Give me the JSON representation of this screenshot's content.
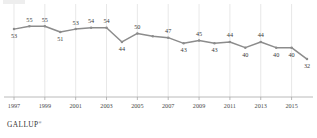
{
  "brand": {
    "name": "GALLUP",
    "mark": "®"
  },
  "chart_data": {
    "type": "line",
    "title": "",
    "subtitle": "",
    "xlabel": "",
    "ylabel": "",
    "grid": "vertical",
    "legend": null,
    "xlim": [
      1997,
      2016
    ],
    "ylim": [
      0,
      60
    ],
    "x": [
      1997,
      1998,
      1999,
      2000,
      2001,
      2002,
      2003,
      2004,
      2005,
      2006,
      2007,
      2008,
      2009,
      2010,
      2011,
      2012,
      2013,
      2014,
      2015,
      2016
    ],
    "values": [
      53,
      55,
      55,
      51,
      53,
      54,
      54,
      44,
      50,
      48,
      47,
      43,
      45,
      43,
      44,
      40,
      44,
      40,
      40,
      32
    ],
    "point_labels": [
      "53",
      "55",
      "55",
      "51",
      "53",
      "54",
      "54",
      "44",
      "50",
      "",
      "47",
      "43",
      "45",
      "43",
      "44",
      "40",
      "44",
      "40",
      "40",
      "32"
    ],
    "label_positions": [
      "below",
      "above",
      "above",
      "below",
      "above",
      "above",
      "above",
      "below",
      "above",
      "",
      "above",
      "below",
      "above",
      "below",
      "above",
      "below",
      "above",
      "below",
      "below",
      "below"
    ],
    "tick_labels": [
      "1997",
      "1999",
      "2001",
      "2003",
      "2005",
      "2007",
      "2009",
      "2011",
      "2013",
      "2015"
    ],
    "tick_values": [
      1997,
      1999,
      2001,
      2003,
      2005,
      2007,
      2009,
      2011,
      2013,
      2015
    ],
    "series": [
      {
        "name": "",
        "color": "#8c8c8c",
        "values": [
          53,
          55,
          55,
          51,
          53,
          54,
          54,
          44,
          50,
          48,
          47,
          43,
          45,
          43,
          44,
          40,
          44,
          40,
          40,
          32
        ]
      }
    ]
  }
}
